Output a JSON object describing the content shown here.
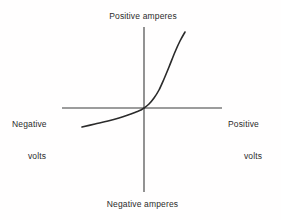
{
  "figure": {
    "background_color": "#fffefe",
    "ink_color": "#2b2b2b",
    "width": 281,
    "height": 220
  },
  "labels": {
    "top": "Positive amperes",
    "bottom": "Negative amperes",
    "left_line1": "Negative",
    "left_line2": "volts",
    "right_line1": "Positive",
    "right_line2": "volts"
  },
  "chart_data": {
    "type": "line",
    "title": "",
    "subtitle": "",
    "xlabel": "volts",
    "ylabel": "amperes",
    "grid": false,
    "legend": null,
    "axes": {
      "x_axis": {
        "negative_label": "Negative volts",
        "positive_label": "Positive volts",
        "pixel_y": 108,
        "pixel_x_start": 62,
        "pixel_x_end": 222
      },
      "y_axis": {
        "negative_label": "Negative amperes",
        "positive_label": "Positive amperes",
        "pixel_x": 144,
        "pixel_y_start": 27,
        "pixel_y_end": 192
      },
      "origin": [
        144,
        108
      ],
      "xlim": [
        -1,
        1
      ],
      "ylim": [
        -1,
        1
      ]
    },
    "series": [
      {
        "name": "diode I-V curve",
        "stroke_color": "#2b2b2b",
        "stroke_width": 1.6,
        "points_pixel": [
          [
            82,
            127
          ],
          [
            95,
            124
          ],
          [
            108,
            121
          ],
          [
            119,
            118
          ],
          [
            128,
            115
          ],
          [
            136,
            112
          ],
          [
            141,
            110
          ],
          [
            144,
            108
          ],
          [
            149,
            104
          ],
          [
            154,
            98
          ],
          [
            159,
            90
          ],
          [
            164,
            79
          ],
          [
            169,
            67
          ],
          [
            175,
            52
          ],
          [
            180,
            41
          ],
          [
            185,
            32
          ]
        ],
        "x": [
          -0.78,
          -0.61,
          -0.45,
          -0.31,
          -0.2,
          -0.1,
          -0.04,
          0.0,
          0.06,
          0.13,
          0.19,
          0.25,
          0.31,
          0.39,
          0.45,
          0.51
        ],
        "values": [
          -0.23,
          -0.19,
          -0.16,
          -0.12,
          -0.08,
          -0.05,
          -0.02,
          0.0,
          0.05,
          0.12,
          0.22,
          0.35,
          0.5,
          0.68,
          0.81,
          0.92
        ]
      }
    ]
  }
}
